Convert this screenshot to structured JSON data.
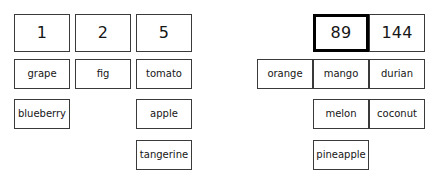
{
  "board": {
    "background_color": "#ffffff",
    "card_border_color": "#3a3a3a",
    "selected_border_color": "#000000",
    "text_color": "#161616"
  },
  "groups": [
    {
      "name": "left-group",
      "columns": [
        {
          "header": {
            "label": "1",
            "selected": false
          },
          "items": [
            {
              "label": "grape"
            },
            {
              "label": "blueberry"
            }
          ]
        },
        {
          "header": {
            "label": "2",
            "selected": false
          },
          "items": [
            {
              "label": "fig"
            }
          ]
        },
        {
          "header": {
            "label": "5",
            "selected": false
          },
          "items": [
            {
              "label": "tomato"
            },
            {
              "label": "apple"
            },
            {
              "label": "tangerine"
            }
          ]
        }
      ]
    },
    {
      "name": "right-group",
      "columns": [
        {
          "header": {
            "label": "",
            "selected": false,
            "hidden": true
          },
          "items": [
            {
              "label": "orange"
            }
          ]
        },
        {
          "header": {
            "label": "89",
            "selected": true
          },
          "items": [
            {
              "label": "mango"
            },
            {
              "label": "melon"
            },
            {
              "label": "pineapple"
            }
          ]
        },
        {
          "header": {
            "label": "144",
            "selected": false
          },
          "items": [
            {
              "label": "durian"
            },
            {
              "label": "coconut"
            }
          ]
        }
      ]
    }
  ]
}
